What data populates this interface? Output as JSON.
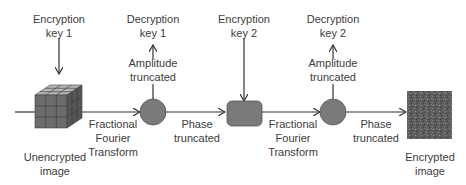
{
  "diagram": {
    "nodes": [
      {
        "id": "input",
        "label_line1": "Unencrypted",
        "label_line2": "image",
        "shape": "cube-icon"
      },
      {
        "id": "pt1",
        "shape": "circle",
        "color": "#7a7a7a"
      },
      {
        "id": "mult2",
        "shape": "rounded-rect",
        "color": "#7a7a7a"
      },
      {
        "id": "pt2",
        "shape": "circle",
        "color": "#7a7a7a"
      },
      {
        "id": "output",
        "label_line1": "Encrypted",
        "label_line2": "image",
        "shape": "noise-square"
      }
    ],
    "keys": {
      "enc1": {
        "line1": "Encryption",
        "line2": "key 1"
      },
      "dec1": {
        "line1": "Decryption",
        "line2": "key 1"
      },
      "enc2": {
        "line1": "Encryption",
        "line2": "key 2"
      },
      "dec2": {
        "line1": "Decryption",
        "line2": "key 2"
      }
    },
    "edge_labels": {
      "frft1": {
        "line1": "Fractional",
        "line2": "Fourier",
        "line3": "Transform"
      },
      "phase1": {
        "line1": "Phase",
        "line2": "truncated"
      },
      "frft2": {
        "line1": "Fractional",
        "line2": "Fourier",
        "line3": "Transform"
      },
      "phase2": {
        "line1": "Phase",
        "line2": "truncated"
      },
      "amp1": {
        "line1": "Amplitude",
        "line2": "truncated"
      },
      "amp2": {
        "line1": "Amplitude",
        "line2": "truncated"
      }
    },
    "colors": {
      "line": "#333333",
      "node_fill": "#7a7a7a",
      "text": "#3c3c3c"
    }
  }
}
